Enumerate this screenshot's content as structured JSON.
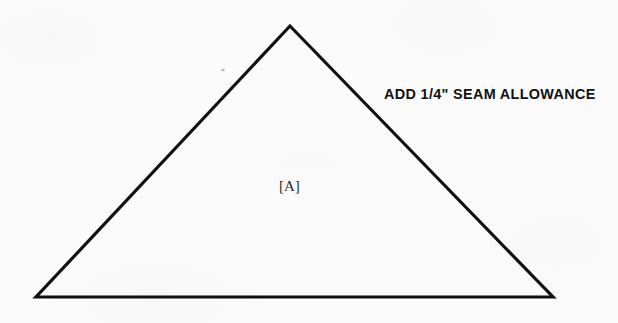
{
  "canvas": {
    "width": 618,
    "height": 323,
    "background_color": "#fbfbfb",
    "ink_color": "#111111"
  },
  "pattern_piece": {
    "shape": "triangle",
    "label": "[A]",
    "instruction": "ADD 1/4\" SEAM ALLOWANCE",
    "stroke_color": "#111111",
    "stroke_width": 3,
    "vertices": {
      "apex": {
        "x": 290,
        "y": 26
      },
      "bottom_left": {
        "x": 36,
        "y": 297
      },
      "bottom_right": {
        "x": 553,
        "y": 297
      }
    },
    "label_position": {
      "x": 291,
      "y": 187
    },
    "instruction_position": {
      "x": 384,
      "y": 95
    }
  },
  "artifacts": {
    "scan_speck": {
      "x": 221,
      "y": 69
    }
  }
}
